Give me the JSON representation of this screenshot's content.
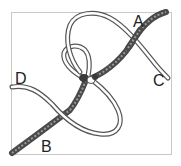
{
  "diagram": {
    "type": "knot-tying illustration",
    "labels": {
      "a": "A",
      "b": "B",
      "c": "C",
      "d": "D"
    },
    "colors": {
      "frame": "#c8c8c8",
      "dark_rope": "#5a5a5a",
      "dark_rope_texture": "#8a8a8a",
      "light_rope_outline": "#555555",
      "light_rope_fill": "#ffffff",
      "label": "#222222"
    }
  }
}
